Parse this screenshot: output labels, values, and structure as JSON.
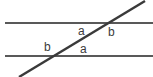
{
  "diagram": {
    "canvas": {
      "width": 153,
      "height": 77,
      "background": "#ffffff"
    },
    "colors": {
      "parallel_line": "#595959",
      "transversal_line": "#3a3a3a",
      "label_text": "#3b3b3b"
    },
    "lines": [
      {
        "name": "upper-parallel-line",
        "kind": "horizontal",
        "x1": 5,
        "y1": 23,
        "x2": 153,
        "y2": 23,
        "thickness": 1.6
      },
      {
        "name": "lower-parallel-line",
        "kind": "horizontal",
        "x1": 5,
        "y1": 56,
        "x2": 153,
        "y2": 56,
        "thickness": 1.6
      },
      {
        "name": "transversal-line",
        "kind": "diagonal",
        "x1": 19,
        "y1": 77,
        "x2": 145,
        "y2": 1,
        "thickness": 2.4
      }
    ],
    "intersections": [
      {
        "name": "upper-intersection",
        "x": 106,
        "y": 23
      },
      {
        "name": "lower-intersection",
        "x": 58,
        "y": 56
      }
    ],
    "labels": [
      {
        "name": "angle-label-a-upper",
        "text": "a",
        "x": 78,
        "y": 25,
        "position": "left-below-upper-intersection"
      },
      {
        "name": "angle-label-b-upper",
        "text": "b",
        "x": 108,
        "y": 26,
        "position": "right-below-upper-intersection"
      },
      {
        "name": "angle-label-b-lower",
        "text": "b",
        "x": 44,
        "y": 41,
        "position": "left-above-lower-intersection"
      },
      {
        "name": "angle-label-a-lower",
        "text": "a",
        "x": 80,
        "y": 43,
        "position": "right-above-lower-intersection"
      }
    ]
  }
}
